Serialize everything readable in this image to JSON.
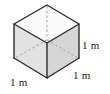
{
  "figure": {
    "name": "unit-cube-diagram",
    "shape": "cube",
    "colors": {
      "background": "#ffffff",
      "face_top": "#fbfbfb",
      "face_left": "#e2e2e2",
      "face_right": "#d6d6d6",
      "edge_visible": "#2b2b2b",
      "edge_hidden": "#b4b4b4",
      "label_text": "#1c1c1c"
    },
    "labels": {
      "right_edge": "1 m",
      "front_edge": "1 m",
      "left_edge": "1 m"
    },
    "unit": "m",
    "edge_length": "1"
  }
}
